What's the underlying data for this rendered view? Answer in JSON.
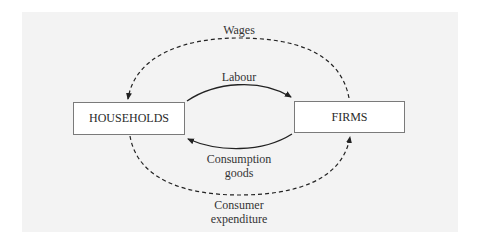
{
  "diagram": {
    "nodes": {
      "households": "HOUSEHOLDS",
      "firms": "FIRMS"
    },
    "flows": {
      "wages": {
        "label": "Wages",
        "from": "firms",
        "to": "households",
        "style": "dashed"
      },
      "labour": {
        "label": "Labour",
        "from": "households",
        "to": "firms",
        "style": "solid"
      },
      "consumption_goods": {
        "label_line1": "Consumption",
        "label_line2": "goods",
        "from": "firms",
        "to": "households",
        "style": "solid"
      },
      "consumer_expenditure": {
        "label_line1": "Consumer",
        "label_line2": "expenditure",
        "from": "households",
        "to": "firms",
        "style": "dashed"
      }
    },
    "colors": {
      "background_panel": "#f3f3f3",
      "line": "#222222",
      "box_border": "#7a7a7a"
    }
  }
}
